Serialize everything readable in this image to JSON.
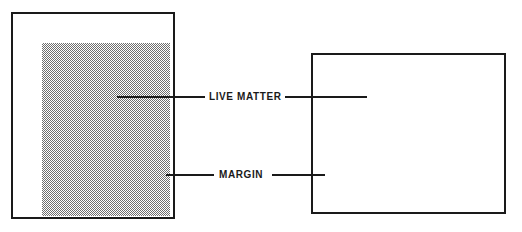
{
  "diagram": {
    "type": "page-layout-diagram",
    "background_color": "#ffffff",
    "line_color": "#1a1a1a",
    "fill_pattern": "halftone-dot-screen",
    "fill_color": "#6f6f6f"
  },
  "labels": {
    "live_matter": "LIVE MATTER",
    "margin": "MARGIN"
  },
  "pages": [
    {
      "name": "portrait-page",
      "orientation": "portrait",
      "live_matter_label": "LIVE MATTER",
      "margin_label": "MARGIN"
    },
    {
      "name": "landscape-page",
      "orientation": "landscape",
      "live_matter_label": "LIVE MATTER",
      "margin_label": "MARGIN"
    }
  ]
}
